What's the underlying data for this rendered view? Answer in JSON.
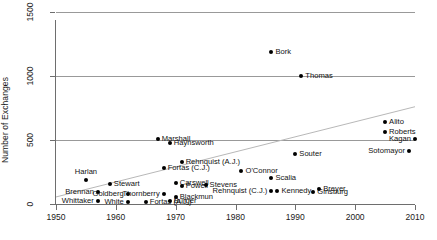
{
  "chart_data": {
    "type": "scatter",
    "title": "",
    "xlabel": "",
    "ylabel": "Number of Exchanges",
    "xlim": [
      1950,
      2010
    ],
    "ylim": [
      0,
      1500
    ],
    "xticks": [
      1950,
      1960,
      1970,
      1980,
      1990,
      2000,
      2010
    ],
    "yticks": [
      0,
      500,
      1000,
      1500
    ],
    "grid": true,
    "legend_position": "none",
    "annotations": [
      "faint grey linear trend line rising left to right"
    ],
    "trendline": {
      "x": [
        1950,
        2010
      ],
      "y": [
        55,
        760
      ]
    },
    "points": [
      {
        "label": "Harlan",
        "x": 1955,
        "y": 185,
        "side": "above"
      },
      {
        "label": "Brennan",
        "x": 1957,
        "y": 95,
        "side": "left"
      },
      {
        "label": "Whittaker",
        "x": 1957,
        "y": 20,
        "side": "left"
      },
      {
        "label": "Goldberg",
        "x": 1962,
        "y": 75,
        "side": "left"
      },
      {
        "label": "White",
        "x": 1962,
        "y": 18,
        "side": "left"
      },
      {
        "label": "Stewart",
        "x": 1959,
        "y": 155,
        "side": "right"
      },
      {
        "label": "Fortas (A.J.)",
        "x": 1965,
        "y": 18,
        "side": "right"
      },
      {
        "label": "Marshall",
        "x": 1967,
        "y": 510,
        "side": "right"
      },
      {
        "label": "Haynsworth",
        "x": 1969,
        "y": 480,
        "side": "right"
      },
      {
        "label": "Fortas (C.J.)",
        "x": 1968,
        "y": 280,
        "side": "right"
      },
      {
        "label": "Thornberry",
        "x": 1968,
        "y": 80,
        "side": "left"
      },
      {
        "label": "Burger",
        "x": 1969,
        "y": 25,
        "side": "right"
      },
      {
        "label": "Carswell",
        "x": 1970,
        "y": 165,
        "side": "right"
      },
      {
        "label": "Powell",
        "x": 1971,
        "y": 140,
        "side": "right"
      },
      {
        "label": "Blackmun",
        "x": 1970,
        "y": 55,
        "side": "right"
      },
      {
        "label": "Rehnquist (A.J.)",
        "x": 1971,
        "y": 330,
        "side": "right"
      },
      {
        "label": "Stevens",
        "x": 1975,
        "y": 145,
        "side": "right"
      },
      {
        "label": "O'Connor",
        "x": 1981,
        "y": 260,
        "side": "right"
      },
      {
        "label": "Scalia",
        "x": 1986,
        "y": 200,
        "side": "right"
      },
      {
        "label": "Bork",
        "x": 1986,
        "y": 1185,
        "side": "right"
      },
      {
        "label": "Rehnquist (C.J.)",
        "x": 1986,
        "y": 100,
        "side": "left"
      },
      {
        "label": "Kennedy",
        "x": 1987,
        "y": 100,
        "side": "right"
      },
      {
        "label": "Souter",
        "x": 1990,
        "y": 390,
        "side": "right"
      },
      {
        "label": "Thomas",
        "x": 1991,
        "y": 1000,
        "side": "right"
      },
      {
        "label": "Ginsburg",
        "x": 1993,
        "y": 95,
        "side": "right"
      },
      {
        "label": "Breyer",
        "x": 1994,
        "y": 120,
        "side": "right"
      },
      {
        "label": "Roberts",
        "x": 2005,
        "y": 560,
        "side": "right"
      },
      {
        "label": "Alito",
        "x": 2005,
        "y": 640,
        "side": "right"
      },
      {
        "label": "Sotomayor",
        "x": 2009,
        "y": 415,
        "side": "left"
      },
      {
        "label": "Kagan",
        "x": 2010,
        "y": 510,
        "side": "left"
      }
    ]
  }
}
